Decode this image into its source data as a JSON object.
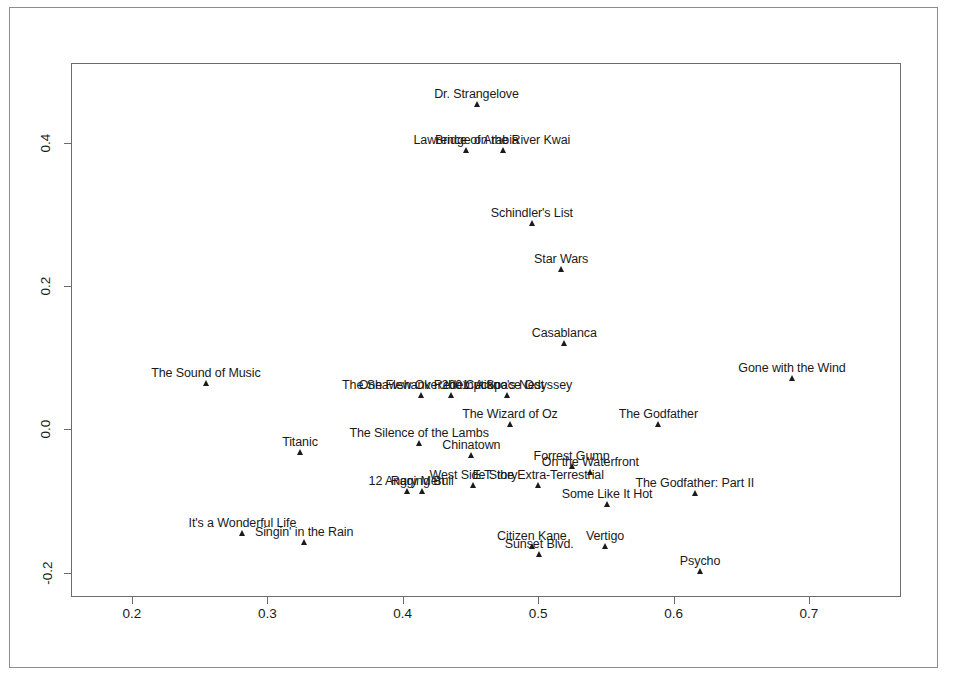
{
  "figure": {
    "background": "#ffffff",
    "frame_color": "#6b6b6b",
    "marker_color": "#1a1a1a",
    "border_color": "#8d8d8d"
  },
  "chart_data": {
    "type": "scatter",
    "title": "",
    "xlabel": "",
    "ylabel": "",
    "xlim": [
      0.155,
      0.768
    ],
    "ylim": [
      -0.234,
      0.511
    ],
    "grid": false,
    "legend": "none",
    "xticks": [
      0.2,
      0.3,
      0.4,
      0.5,
      0.6,
      0.7
    ],
    "xtick_labels": [
      "0.2",
      "0.3",
      "0.4",
      "0.5",
      "0.6",
      "0.7"
    ],
    "yticks": [
      0.4,
      0.2,
      0.0,
      -0.2
    ],
    "ytick_labels": [
      "0.4",
      "0.2",
      "0.0",
      "-0.2"
    ],
    "point_label_position": "above",
    "points": [
      {
        "label": "Dr. Strangelove",
        "x": 0.4545,
        "y": 0.4495
      },
      {
        "label": "Lawrence of Arabia",
        "x": 0.4468,
        "y": 0.385
      },
      {
        "label": "Bridge on the River Kwai",
        "x": 0.4738,
        "y": 0.385
      },
      {
        "label": "Schindler's List",
        "x": 0.4954,
        "y": 0.2832
      },
      {
        "label": "Star Wars",
        "x": 0.517,
        "y": 0.22
      },
      {
        "label": "Casablanca",
        "x": 0.5193,
        "y": 0.1155
      },
      {
        "label": "The Sound of Music",
        "x": 0.2546,
        "y": 0.0606
      },
      {
        "label": "Gone with the Wind",
        "x": 0.6875,
        "y": 0.0674
      },
      {
        "label": "One Flew Over the Cuckoo's Nest",
        "x": 0.436,
        "y": 0.0431
      },
      {
        "label": "The Shawshank Redemption",
        "x": 0.4136,
        "y": 0.0431
      },
      {
        "label": "2001: A Space Odyssey",
        "x": 0.4769,
        "y": 0.0431
      },
      {
        "label": "The Wizard of Oz",
        "x": 0.4792,
        "y": 0.0027
      },
      {
        "label": "The Godfather",
        "x": 0.5888,
        "y": 0.0027
      },
      {
        "label": "The Silence of the Lambs",
        "x": 0.4121,
        "y": -0.024
      },
      {
        "label": "Titanic",
        "x": 0.3241,
        "y": -0.036
      },
      {
        "label": "Chinatown",
        "x": 0.4507,
        "y": -0.04
      },
      {
        "label": "Forrest Gump",
        "x": 0.5247,
        "y": -0.0554
      },
      {
        "label": "On the Waterfront",
        "x": 0.5386,
        "y": -0.0635
      },
      {
        "label": "West Side Story",
        "x": 0.4522,
        "y": -0.082
      },
      {
        "label": "E.T. the Extra-Terrestrial",
        "x": 0.5,
        "y": -0.082
      },
      {
        "label": "12 Angry Men",
        "x": 0.4028,
        "y": -0.0909
      },
      {
        "label": "Raging Bull",
        "x": 0.4144,
        "y": -0.0909
      },
      {
        "label": "Some Like It Hot",
        "x": 0.5509,
        "y": -0.1084
      },
      {
        "label": "The Godfather: Part II",
        "x": 0.6157,
        "y": -0.0933
      },
      {
        "label": "It's a Wonderful Life",
        "x": 0.2816,
        "y": -0.149
      },
      {
        "label": "Singin' in the Rain",
        "x": 0.3272,
        "y": -0.1611
      },
      {
        "label": "Citizen Kane",
        "x": 0.4954,
        "y": -0.1667
      },
      {
        "label": "Sunset Blvd.",
        "x": 0.5008,
        "y": -0.178
      },
      {
        "label": "Vertigo",
        "x": 0.5494,
        "y": -0.1667
      },
      {
        "label": "Psycho",
        "x": 0.6196,
        "y": -0.2022
      }
    ]
  }
}
